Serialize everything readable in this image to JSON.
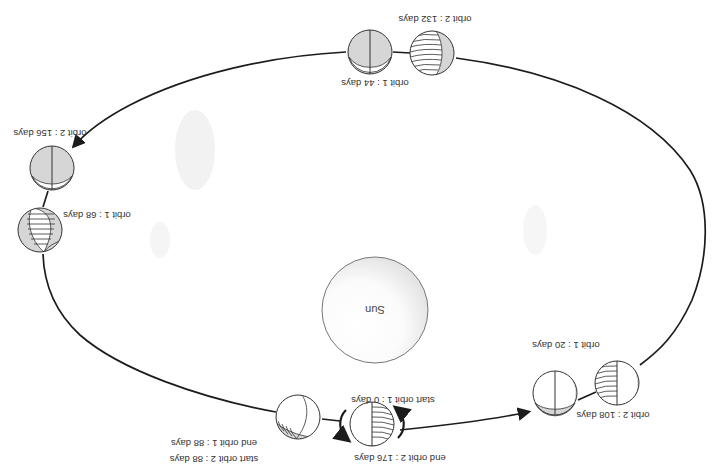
{
  "diagram": {
    "orientation": "rotated 180 degrees",
    "sun": {
      "label": "Sun"
    },
    "colors": {
      "orbit_line": "#1c1c1c",
      "planet_shade": "#d6d6d6",
      "planet_light": "#ffffff",
      "text": "#333333"
    },
    "planets": [
      {
        "id": "p0",
        "label": "start orbit 1 : 0 days",
        "label2": "end orbit 2 : 176 days"
      },
      {
        "id": "p20",
        "label": "orbit 1 : 20 days",
        "label2": ""
      },
      {
        "id": "p108",
        "label": "orbit 2 : 108 days",
        "label2": ""
      },
      {
        "id": "p44",
        "label": "orbit 1 : 44 days",
        "label2": ""
      },
      {
        "id": "p132",
        "label": "orbit 2 : 132 days",
        "label2": ""
      },
      {
        "id": "p156",
        "label": "orbit 2 : 156 days",
        "label2": ""
      },
      {
        "id": "p68",
        "label": "orbit 1 : 68 days",
        "label2": ""
      },
      {
        "id": "p88",
        "label": "end orbit 1 : 88 days",
        "label2": "start orbit 2 : 88 days"
      }
    ]
  }
}
